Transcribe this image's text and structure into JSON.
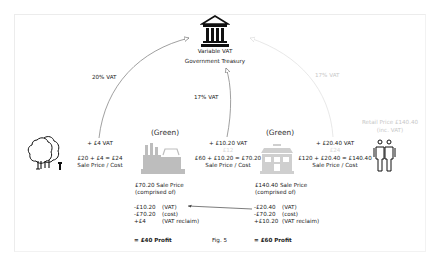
{
  "figure": {
    "caption": "Fig. 5",
    "colors": {
      "text": "#222222",
      "faint_text": "#c8c8c8",
      "arrow_dark": "#666666",
      "arrow_faint": "#e0e0e0",
      "factory_gray": "#bdbdbd",
      "shop_gray": "#cfcfcf"
    }
  },
  "treasury": {
    "icon": "government-building-icon",
    "line1": "Variable VAT",
    "line2": "Government Treasury"
  },
  "flows": [
    {
      "label": "20% VAT",
      "from": "grower",
      "to": "treasury"
    },
    {
      "label": "17% VAT",
      "from": "manufacturer",
      "to": "treasury"
    },
    {
      "label": "17% VAT",
      "from": "retailer",
      "to": "treasury",
      "faint": true
    }
  ],
  "grower": {
    "icon": "trees-icon",
    "vat_added": "+ £4 VAT",
    "calc": "£20 + £4 = £24",
    "calc_label": "Sale Price / Cost"
  },
  "manufacturer": {
    "heading": "(Green)",
    "icon": "factory-icon",
    "vat_added": "+ £10.20 VAT",
    "vat_note": "£12",
    "calc": "£60 + £10.20 = £70.20",
    "calc_label": "Sale Price / Cost",
    "sale_title": "£70.20 Sale Price",
    "sale_sub": "(comprised of)",
    "lines": [
      {
        "amount": "-£10.20",
        "desc": "(VAT)"
      },
      {
        "amount": "-£70.20",
        "desc": "(cost)"
      },
      {
        "amount": "+£4",
        "desc": "(VAT reclaim)"
      }
    ],
    "profit": "= £40 Profit"
  },
  "retailer": {
    "heading": "(Green)",
    "icon": "shop-icon",
    "vat_added": "+ £20.40 VAT",
    "vat_note": "£24",
    "calc": "£120 + £20.40 = £140.40",
    "calc_label": "Sale Price / Cost",
    "sale_title": "£140.40 Sale Price",
    "sale_sub": "(comprised of)",
    "lines": [
      {
        "amount": "-£20.40",
        "desc": "(VAT)"
      },
      {
        "amount": "-£70.20",
        "desc": "(cost)"
      },
      {
        "amount": "+£10.20",
        "desc": "(VAT reclaim)"
      }
    ],
    "profit": "= £60 Profit"
  },
  "consumer": {
    "icon": "people-icon",
    "retail_line1": "Retail Price £140.40",
    "retail_line2": "(inc. VAT)"
  }
}
